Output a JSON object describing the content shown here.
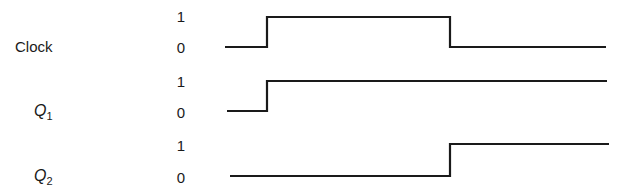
{
  "diagram": {
    "type": "timing-diagram",
    "line_color": "#1a1a1a",
    "signals": [
      {
        "name": "Clock",
        "label_main": "Clock",
        "label_sub": "",
        "levels": {
          "high": "1",
          "low": "0"
        },
        "transitions": [
          {
            "from": 0,
            "to": 1,
            "at": "t1"
          },
          {
            "from": 1,
            "to": 0,
            "at": "t2"
          }
        ]
      },
      {
        "name": "Q1",
        "label_main": "Q",
        "label_sub": "1",
        "levels": {
          "high": "1",
          "low": "0"
        },
        "transitions": [
          {
            "from": 0,
            "to": 1,
            "at": "t1"
          }
        ]
      },
      {
        "name": "Q2",
        "label_main": "Q",
        "label_sub": "2",
        "levels": {
          "high": "1",
          "low": "0"
        },
        "transitions": [
          {
            "from": 0,
            "to": 1,
            "at": "t2"
          }
        ]
      }
    ]
  }
}
